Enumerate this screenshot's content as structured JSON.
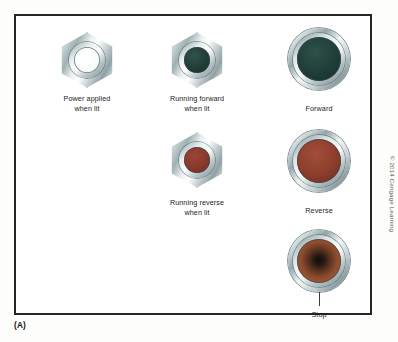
{
  "figure": {
    "part_label": "(A)",
    "copyright": "© 2014 Cengage Learning",
    "frame_color": "#262626",
    "background_color": "#ffffff"
  },
  "devices": [
    {
      "name": "power-applied-pilot-light",
      "style": "hex-nut-pilot-light",
      "lens_state": "off",
      "lens_color": "#ffffff",
      "caption": "Power applied\nwhen lit"
    },
    {
      "name": "running-forward-pilot-light",
      "style": "hex-nut-pilot-light",
      "lens_state": "green",
      "lens_color": "#1d3a33",
      "caption": "Running forward\nwhen lit"
    },
    {
      "name": "forward-push-button",
      "style": "round-push-button",
      "lens_state": "green",
      "lens_color": "#1d3a33",
      "caption": "Forward"
    },
    {
      "name": "running-reverse-pilot-light",
      "style": "hex-nut-pilot-light",
      "lens_state": "red",
      "lens_color": "#7e3224",
      "caption": "Running reverse\nwhen lit"
    },
    {
      "name": "reverse-push-button",
      "style": "round-push-button",
      "lens_state": "red",
      "lens_color": "#8b3e2c",
      "caption": "Reverse"
    },
    {
      "name": "stop-push-button",
      "style": "round-mushroom-button",
      "lens_state": "mushroom",
      "lens_color": "#8a4a2c",
      "caption": "Stop"
    }
  ]
}
